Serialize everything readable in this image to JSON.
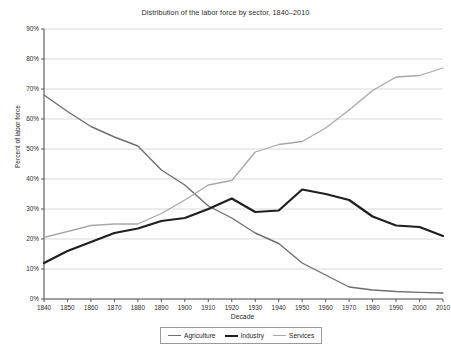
{
  "chart_data": {
    "type": "line",
    "title": "Distribution of the labor force by sector, 1840–2010",
    "xlabel": "Decade",
    "ylabel": "Percent of labor force",
    "grid": true,
    "legend_position": "bottom",
    "xlim": [
      1840,
      2010
    ],
    "ylim": [
      0,
      90
    ],
    "ytick_labels": [
      "0%",
      "10%",
      "20%",
      "30%",
      "40%",
      "50%",
      "60%",
      "70%",
      "80%",
      "90%"
    ],
    "ytick_values": [
      0,
      10,
      20,
      30,
      40,
      50,
      60,
      70,
      80,
      90
    ],
    "categories": [
      1840,
      1850,
      1860,
      1870,
      1880,
      1890,
      1900,
      1910,
      1920,
      1930,
      1940,
      1950,
      1960,
      1970,
      1980,
      1990,
      2000,
      2010
    ],
    "xtick_labels": [
      "1840",
      "1850",
      "1860",
      "1870",
      "1880",
      "1890",
      "1900",
      "1910",
      "1920",
      "1930",
      "1940",
      "1950",
      "1960",
      "1970",
      "1980",
      "1990",
      "2000",
      "2010"
    ],
    "series": [
      {
        "name": "Agriculture",
        "color": "#6e6e6e",
        "width": 1.4,
        "values": [
          68,
          62.5,
          57.5,
          54,
          51,
          43,
          38,
          31,
          27,
          22,
          18.5,
          12,
          8,
          4,
          3,
          2.5,
          2.2,
          2
        ]
      },
      {
        "name": "Industry",
        "color": "#1f1f1f",
        "width": 2.2,
        "values": [
          12,
          16,
          19,
          22,
          23.5,
          26,
          27,
          30,
          33.5,
          29,
          29.5,
          36.5,
          35,
          33,
          27.5,
          24.5,
          24,
          21
        ]
      },
      {
        "name": "Services",
        "color": "#a8a8a8",
        "width": 1.3,
        "values": [
          20.5,
          22.5,
          24.5,
          25,
          25,
          28.5,
          33,
          38,
          39.5,
          49,
          51.5,
          52.5,
          57,
          63,
          69.5,
          74,
          74.5,
          77
        ]
      }
    ]
  },
  "legend": {
    "items": [
      {
        "label": "Agriculture",
        "color": "#6e6e6e",
        "width": 1.4
      },
      {
        "label": "Industry",
        "color": "#1f1f1f",
        "width": 2.4
      },
      {
        "label": "Services",
        "color": "#a8a8a8",
        "width": 1.3
      }
    ]
  }
}
